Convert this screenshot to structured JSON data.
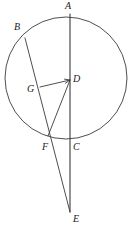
{
  "figure": {
    "background_color": "#ffffff",
    "stroke_color": "#3a3a3a",
    "label_color": "#1a1a1a",
    "width": 133,
    "height": 233
  },
  "circle": {
    "name": "main-circle",
    "center_x": 66,
    "center_y": 78,
    "radius": 61,
    "stroke_width": 0.9
  },
  "points": [
    {
      "id": "A",
      "label": "A",
      "x": 70,
      "y": 14,
      "label_x": 65,
      "label_y": 1
    },
    {
      "id": "B",
      "label": "B",
      "x": 25,
      "y": 38,
      "label_x": 14,
      "label_y": 22
    },
    {
      "id": "D",
      "label": "D",
      "x": 70,
      "y": 80,
      "label_x": 73,
      "label_y": 74
    },
    {
      "id": "G",
      "label": "G",
      "x": 40,
      "y": 87,
      "label_x": 27,
      "label_y": 84
    },
    {
      "id": "F",
      "label": "F",
      "x": 48,
      "y": 136,
      "label_x": 42,
      "label_y": 142
    },
    {
      "id": "C",
      "label": "C",
      "x": 70,
      "y": 140,
      "label_x": 73,
      "label_y": 142
    },
    {
      "id": "E",
      "label": "E",
      "x": 70,
      "y": 212,
      "label_x": 73,
      "label_y": 214
    }
  ],
  "segments": [
    {
      "id": "AE",
      "name": "segment-a-to-e",
      "x1": 70,
      "y1": 14,
      "x2": 70,
      "y2": 212,
      "stroke_width": 1.1
    },
    {
      "id": "BE",
      "name": "segment-b-to-e",
      "x1": 25,
      "y1": 38,
      "x2": 70,
      "y2": 212,
      "stroke_width": 0.9
    },
    {
      "id": "DF",
      "name": "segment-d-to-f",
      "x1": 70,
      "y1": 80,
      "x2": 48,
      "y2": 136,
      "stroke_width": 0.9
    },
    {
      "id": "GD",
      "name": "segment-g-to-d",
      "x1": 40,
      "y1": 87,
      "x2": 70,
      "y2": 80,
      "stroke_width": 0.9,
      "arrow_at_end": true
    }
  ],
  "labels_style": {
    "font_style": "italic",
    "font_size_px": 10
  }
}
